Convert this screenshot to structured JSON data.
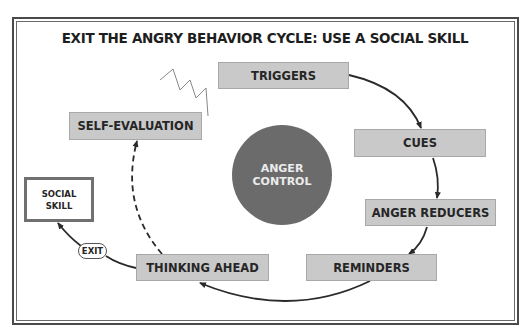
{
  "title": "EXIT THE ANGRY BEHAVIOR CYCLE: USE A SOCIAL SKILL",
  "center": {
    "line1": "ANGER",
    "line2": "CONTROL",
    "color": "#6b6b6b"
  },
  "cycle_steps": [
    {
      "label": "TRIGGERS"
    },
    {
      "label": "CUES"
    },
    {
      "label": "ANGER REDUCERS"
    },
    {
      "label": "REMINDERS"
    },
    {
      "label": "THINKING AHEAD"
    },
    {
      "label": "SELF-EVALUATION"
    }
  ],
  "exit": {
    "label": "EXIT",
    "target": {
      "line1": "SOCIAL",
      "line2": "SKILL"
    }
  },
  "colors": {
    "box_fill": "#c9c9c9",
    "line": "#2a2a2a"
  }
}
